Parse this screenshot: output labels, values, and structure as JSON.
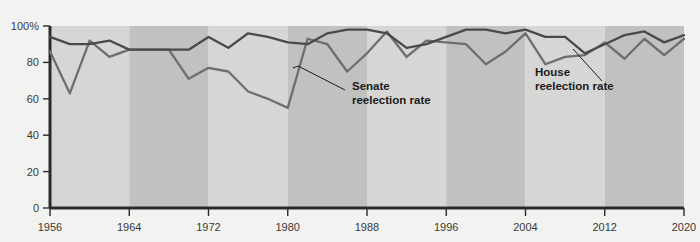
{
  "chart_data": {
    "type": "line",
    "title": "",
    "subtitle": "",
    "xlabel": "",
    "ylabel": "",
    "xlim": [
      1956,
      2020
    ],
    "ylim": [
      0,
      100
    ],
    "grid": false,
    "legend_position": "inline-annotations",
    "y_ticks": [
      "0",
      "20",
      "40",
      "60",
      "80",
      "100%"
    ],
    "y_tick_values": [
      0,
      20,
      40,
      60,
      80,
      100
    ],
    "x_ticks": [
      "1956",
      "1964",
      "1972",
      "1980",
      "1988",
      "1996",
      "2004",
      "2012",
      "2020"
    ],
    "x_tick_values": [
      1956,
      1964,
      1972,
      1980,
      1988,
      1996,
      2004,
      2012,
      2020
    ],
    "x": [
      1956,
      1958,
      1960,
      1962,
      1964,
      1966,
      1968,
      1970,
      1972,
      1974,
      1976,
      1978,
      1980,
      1982,
      1984,
      1986,
      1988,
      1990,
      1992,
      1994,
      1996,
      1998,
      2000,
      2002,
      2004,
      2006,
      2008,
      2010,
      2012,
      2014,
      2016,
      2018,
      2020
    ],
    "series": [
      {
        "name": "House reelection rate",
        "color": "#4a4a4a",
        "values": [
          94,
          90,
          90,
          92,
          87,
          87,
          87,
          87,
          94,
          88,
          96,
          94,
          91,
          90,
          96,
          98,
          98,
          96,
          88,
          90,
          94,
          98,
          98,
          96,
          98,
          94,
          94,
          85,
          90,
          95,
          97,
          91,
          95
        ]
      },
      {
        "name": "Senate reelection rate",
        "color": "#6e6e6e",
        "values": [
          86,
          63,
          92,
          83,
          87,
          87,
          87,
          71,
          77,
          75,
          64,
          60,
          55,
          93,
          90,
          75,
          85,
          97,
          83,
          92,
          91,
          90,
          79,
          86,
          96,
          79,
          83,
          84,
          91,
          82,
          93,
          84,
          93
        ]
      }
    ],
    "bands": [
      {
        "from": 1956,
        "to": 1964,
        "shade": "light"
      },
      {
        "from": 1964,
        "to": 1972,
        "shade": "dark"
      },
      {
        "from": 1972,
        "to": 1980,
        "shade": "light"
      },
      {
        "from": 1980,
        "to": 1988,
        "shade": "dark"
      },
      {
        "from": 1988,
        "to": 1996,
        "shade": "light"
      },
      {
        "from": 1996,
        "to": 2004,
        "shade": "dark"
      },
      {
        "from": 2004,
        "to": 2012,
        "shade": "light"
      },
      {
        "from": 2012,
        "to": 2020,
        "shade": "dark"
      }
    ],
    "annotations": [
      {
        "id": "senate",
        "line1": "Senate",
        "line2": "reelection rate",
        "color": "#5a5a5a"
      },
      {
        "id": "house",
        "line1": "House",
        "line2": "reelection rate",
        "color": "#1b1b1b"
      }
    ],
    "colors": {
      "background": "#f2f2f0",
      "band_light": "#d6d6d4",
      "band_dark": "#c1c1bf",
      "axis": "#2b2b2b",
      "house_line": "#4a4a4a",
      "senate_line": "#6e6e6e"
    }
  }
}
